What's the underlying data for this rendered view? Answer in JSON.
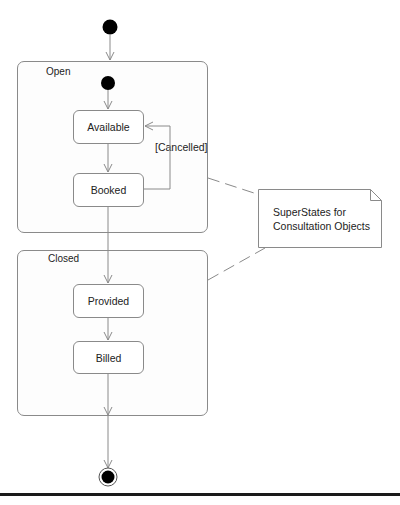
{
  "diagram": {
    "type": "UML state machine diagram",
    "initial_state": {
      "label": "initial-state"
    },
    "final_state": {
      "label": "final-state"
    },
    "superstates": [
      {
        "name": "Open",
        "states": [
          "Available",
          "Booked"
        ]
      },
      {
        "name": "Closed",
        "states": [
          "Provided",
          "Billed"
        ]
      }
    ],
    "states": {
      "available": "Available",
      "booked": "Booked",
      "provided": "Provided",
      "billed": "Billed"
    },
    "transitions": [
      {
        "from": "initial",
        "to": "Open"
      },
      {
        "from": "Open.initial",
        "to": "Available"
      },
      {
        "from": "Available",
        "to": "Booked"
      },
      {
        "from": "Booked",
        "to": "Available",
        "guard": "[Cancelled]"
      },
      {
        "from": "Booked",
        "to": "Provided"
      },
      {
        "from": "Provided",
        "to": "Billed"
      },
      {
        "from": "Billed",
        "to": "final"
      }
    ],
    "guard_label": "[Cancelled]",
    "note": {
      "line1": "SuperStates for",
      "line2": "Consultation Objects"
    },
    "colors": {
      "line": "#8a8a8a",
      "pseudostate": "#000000",
      "rule": "#1a1a1a"
    }
  }
}
